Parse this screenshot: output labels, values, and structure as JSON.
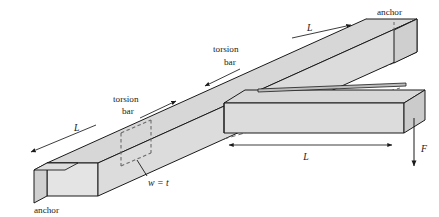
{
  "figure": {
    "type": "engineering-diagram",
    "background_color": "#ffffff",
    "line_color": "#1a1a1a",
    "fill_light": "#dcdcdc",
    "fill_mid": "#d2d2d2",
    "fill_dark": "#c4c4c4",
    "fill_face": "#e4e4e4"
  },
  "labels": {
    "anchor_top_right": "anchor",
    "anchor_bottom_left": "anchor",
    "torsion_bar_upper_line1": "torsion",
    "torsion_bar_upper_line2": "bar",
    "torsion_bar_lower_line1": "torsion",
    "torsion_bar_lower_line2": "bar",
    "cross_section": "w = t",
    "dim_upper_right": "L",
    "dim_lower_left": "L",
    "dim_beam": "L",
    "force": "F"
  }
}
